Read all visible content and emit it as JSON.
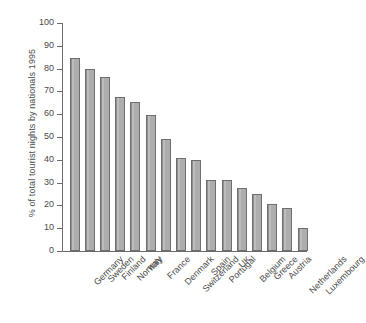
{
  "chart_data": {
    "type": "bar",
    "title": "",
    "subtitle": "",
    "xlabel": "",
    "ylabel": "% of total tourist nights by nationals 1995",
    "ylim": [
      0,
      100
    ],
    "yticks": [
      0,
      10,
      20,
      30,
      40,
      50,
      60,
      70,
      80,
      90,
      100
    ],
    "grid": false,
    "legend": null,
    "bar_color": "#adadad",
    "bar_edge_color": "#6e6e6e",
    "axis_color": "#6b6b6b",
    "background": "#ffffff",
    "categories": [
      "Germany",
      "Sweden",
      "Finland",
      "Norway",
      "Italy",
      "France",
      "Denmark",
      "Switzerland",
      "Spain",
      "Portugal",
      "UK",
      "Belgium",
      "Greece",
      "Austria",
      "Netherlands",
      "Luxembourg"
    ],
    "values": [
      84.5,
      79.8,
      76.5,
      67.5,
      65.5,
      59.5,
      49.0,
      41.0,
      39.7,
      31.2,
      31.2,
      27.5,
      24.8,
      20.7,
      19.0,
      10.3
    ]
  }
}
